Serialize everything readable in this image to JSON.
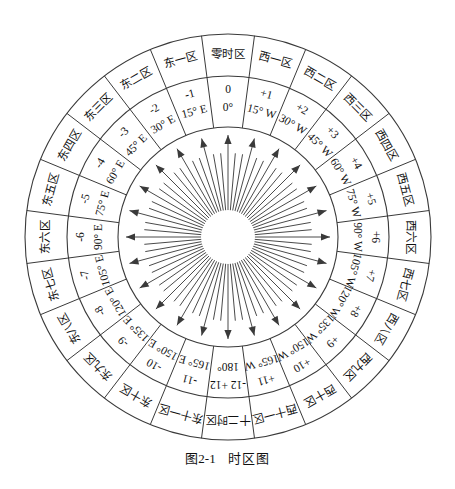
{
  "figure": {
    "caption_prefix": "图2-1",
    "caption_title": "时区图",
    "center_label": "sun-center"
  },
  "geometry": {
    "center_x": 228,
    "center_y": 237,
    "r_outer": 203,
    "r_mid": 161,
    "r_inner": 110,
    "r_sun": 27,
    "sectors": 24,
    "sector_degrees": 15
  },
  "zones": [
    {
      "name": "零时区",
      "offset": "0",
      "meridian": "0°",
      "index": 0
    },
    {
      "name": "西一区",
      "offset": "+1",
      "meridian": "15° W",
      "index": 1
    },
    {
      "name": "西二区",
      "offset": "+2",
      "meridian": "30° W",
      "index": 2
    },
    {
      "name": "西三区",
      "offset": "+3",
      "meridian": "45° W",
      "index": 3
    },
    {
      "name": "西四区",
      "offset": "+4",
      "meridian": "60° W",
      "index": 4
    },
    {
      "name": "西五区",
      "offset": "+5",
      "meridian": "75° W",
      "index": 5
    },
    {
      "name": "西六区",
      "offset": "+6",
      "meridian": "90° W",
      "index": 6
    },
    {
      "name": "西七区",
      "offset": "+7",
      "meridian": "105° W",
      "index": 7
    },
    {
      "name": "西八区",
      "offset": "+8",
      "meridian": "120° W",
      "index": 8
    },
    {
      "name": "西九区",
      "offset": "+9",
      "meridian": "135° W",
      "index": 9
    },
    {
      "name": "西十区",
      "offset": "+10",
      "meridian": "150° W",
      "index": 10
    },
    {
      "name": "西十一区",
      "offset": "+11",
      "meridian": "165° W",
      "index": 11
    },
    {
      "name": "十二时区",
      "offset": "-12 +12",
      "meridian": "180°",
      "index": 12
    },
    {
      "name": "东十一区",
      "offset": "-11",
      "meridian": "165° E",
      "index": 13
    },
    {
      "name": "东十区",
      "offset": "-10",
      "meridian": "150° E",
      "index": 14
    },
    {
      "name": "东九区",
      "offset": "-9",
      "meridian": "135° E",
      "index": 15
    },
    {
      "name": "东八区",
      "offset": "-8",
      "meridian": "120° E",
      "index": 16
    },
    {
      "name": "东七区",
      "offset": "-7",
      "meridian": "105° E",
      "index": 17
    },
    {
      "name": "东六区",
      "offset": "-6",
      "meridian": "90° E",
      "index": 18
    },
    {
      "name": "东五区",
      "offset": "-5",
      "meridian": "75° E",
      "index": 19
    },
    {
      "name": "东四区",
      "offset": "-4",
      "meridian": "60° E",
      "index": 20
    },
    {
      "name": "东三区",
      "offset": "-3",
      "meridian": "45° E",
      "index": 21
    },
    {
      "name": "东二区",
      "offset": "-2",
      "meridian": "30° E",
      "index": 22
    },
    {
      "name": "东一区",
      "offset": "-1",
      "meridian": "15° E",
      "index": 23
    }
  ],
  "colors": {
    "line": "#3a3a3a",
    "ray": "#4a4a4a",
    "text": "#111111",
    "background": "#ffffff"
  }
}
